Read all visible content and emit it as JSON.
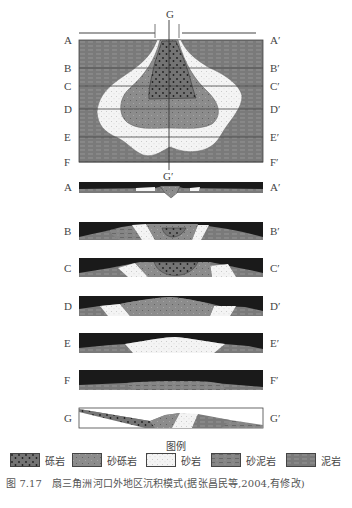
{
  "figure": {
    "plan_view": {
      "top_label": "G",
      "bottom_label": "G′",
      "left_labels": [
        "A",
        "B",
        "C",
        "D",
        "E",
        "F"
      ],
      "right_labels": [
        "A′",
        "B′",
        "C′",
        "D′",
        "E′",
        "F′"
      ]
    },
    "sections": [
      {
        "left": "A",
        "right": "A′"
      },
      {
        "left": "B",
        "right": "B′"
      },
      {
        "left": "C",
        "right": "C′"
      },
      {
        "left": "D",
        "right": "D′"
      },
      {
        "left": "E",
        "right": "E′"
      },
      {
        "left": "F",
        "right": "F′"
      },
      {
        "left": "G",
        "right": "G′"
      }
    ],
    "legend": {
      "title": "图例",
      "items": [
        {
          "label": "砾岩",
          "pattern": "conglomerate"
        },
        {
          "label": "砂砾岩",
          "pattern": "sandy-conglomerate"
        },
        {
          "label": "砂岩",
          "pattern": "sandstone"
        },
        {
          "label": "砂泥岩",
          "pattern": "sandy-mudstone"
        },
        {
          "label": "泥岩",
          "pattern": "mudstone"
        }
      ]
    },
    "caption": "图 7.17　扇三角洲河口外地区沉积模式(据张昌民等,2004,有修改)",
    "colors": {
      "mudstone": "#7d7d7d",
      "sandy_conglomerate": "#8a8a8a",
      "conglomerate": "#6e6e6e",
      "sandstone": "#f3f3f3",
      "water": "#1a1a1a",
      "line": "#333333"
    }
  }
}
